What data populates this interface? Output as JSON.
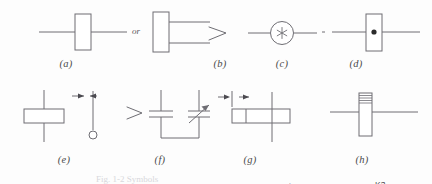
{
  "figure": {
    "caption_partial": "Fig. 1-2  Symbols",
    "row1_labels": [
      "(a)",
      "(b)",
      "(c)",
      "(d)"
    ],
    "row2_labels": [
      "(e)",
      "(f)",
      "(g)",
      "(h)"
    ],
    "connector_word": "or",
    "stroke_color": "#6e6d73",
    "fill_color": "#ffffff",
    "dot_color": "#2b2b2b"
  },
  "symbols": [
    {
      "key": "a",
      "label": "(a)",
      "name": "two-terminal-and-three-terminal-block",
      "description": "Vertical rectangle crossed by a horizontal lead, the word 'or', then a vertical rectangle with two leads on its right side",
      "alt_word": "or"
    },
    {
      "key": "b",
      "label": "(b)",
      "name": "angle-bracket-mark",
      "description": "Small angled chevron / greater-than mark"
    },
    {
      "key": "c",
      "label": "(c)",
      "name": "circle-with-asterisk",
      "description": "Circle containing an asterisk, horizontal leads on both sides",
      "glyph": "*"
    },
    {
      "key": "d",
      "label": "(d)",
      "name": "block-with-center-dot",
      "description": "Vertical rectangle crossed by a horizontal lead with a filled dot at its center"
    },
    {
      "key": "e",
      "label": "(e)",
      "name": "vertical-block-with-dimension-arrows",
      "description": "Horizontal rectangle crossed by a vertical lead, beside a dimension arrow pair over a vertical lead ending in a small open circle"
    },
    {
      "key": "f",
      "label": "(f)",
      "name": "parallel-fixed-and-variable-capacitors",
      "description": "Chevron mark beside two parallel capacitors joined at the bottom; the right capacitor is variable with a diagonal arrow"
    },
    {
      "key": "g",
      "label": "(g)",
      "name": "polarized-block-with-plus-marks",
      "description": "Dimension arrows at left, a horizontal rectangle with a plus sign in its left cell, crossed by a vertical lead, plus sign above right",
      "plus_in_block": "+",
      "plus_above": "+"
    },
    {
      "key": "h",
      "label": "(h)",
      "name": "labeled-coil-block",
      "description": "Vertical block with hatched top crossed by a horizontal lead, labelled K3 above, 3B at left and 5 dagger at right",
      "labels": {
        "top": "K3",
        "left": "3B",
        "right": "5†"
      }
    }
  ]
}
